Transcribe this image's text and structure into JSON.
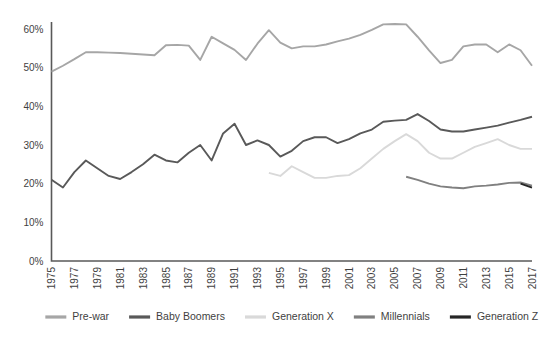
{
  "chart_data": {
    "type": "line",
    "title": "",
    "subtitle": "",
    "xlabel": "",
    "ylabel": "",
    "xlim": [
      1975,
      2017
    ],
    "ylim": [
      0,
      60
    ],
    "grid": false,
    "legend_position": "bottom",
    "y_ticks": [
      "0%",
      "10%",
      "20%",
      "30%",
      "40%",
      "50%",
      "60%"
    ],
    "y_tick_values": [
      0,
      10,
      20,
      30,
      40,
      50,
      60
    ],
    "x_ticks": [
      "1975",
      "1977",
      "1979",
      "1981",
      "1983",
      "1985",
      "1987",
      "1989",
      "1991",
      "1993",
      "1995",
      "1997",
      "1999",
      "2001",
      "2003",
      "2005",
      "2007",
      "2009",
      "2011",
      "2013",
      "2015",
      "2017"
    ],
    "x_tick_values": [
      1975,
      1977,
      1979,
      1981,
      1983,
      1985,
      1987,
      1989,
      1991,
      1993,
      1995,
      1997,
      1999,
      2001,
      2003,
      2005,
      2007,
      2009,
      2011,
      2013,
      2015,
      2017
    ],
    "series": [
      {
        "name": "Pre-war",
        "color": "#A6A6A6",
        "x": [
          1975,
          1976,
          1977,
          1978,
          1979,
          1980,
          1981,
          1982,
          1983,
          1984,
          1985,
          1986,
          1987,
          1988,
          1989,
          1990,
          1991,
          1992,
          1993,
          1994,
          1995,
          1996,
          1997,
          1998,
          1999,
          2000,
          2001,
          2002,
          2003,
          2004,
          2005,
          2006,
          2007,
          2008,
          2009,
          2010,
          2011,
          2012,
          2013,
          2014,
          2015,
          2016,
          2017
        ],
        "values": [
          49.0,
          50.5,
          52.2,
          54.0,
          54.0,
          53.9,
          53.8,
          53.6,
          53.4,
          53.2,
          55.8,
          55.9,
          55.7,
          52.0,
          58.0,
          56.3,
          54.6,
          52.0,
          56.2,
          59.7,
          56.5,
          55.0,
          55.5,
          55.5,
          56.0,
          56.8,
          57.5,
          58.5,
          59.8,
          61.2,
          61.3,
          61.2,
          58.0,
          54.5,
          51.2,
          52.0,
          55.5,
          56.0,
          56.0,
          54.0,
          56.0,
          54.5,
          50.5
        ]
      },
      {
        "name": "Baby Boomers",
        "color": "#595959",
        "x": [
          1975,
          1976,
          1977,
          1978,
          1979,
          1980,
          1981,
          1982,
          1983,
          1984,
          1985,
          1986,
          1987,
          1988,
          1989,
          1990,
          1991,
          1992,
          1993,
          1994,
          1995,
          1996,
          1997,
          1998,
          1999,
          2000,
          2001,
          2002,
          2003,
          2004,
          2005,
          2006,
          2007,
          2008,
          2009,
          2010,
          2011,
          2012,
          2013,
          2014,
          2015,
          2016,
          2017
        ],
        "values": [
          21.0,
          19.0,
          23.0,
          26.0,
          24.0,
          22.0,
          21.2,
          23.0,
          25.0,
          27.5,
          26.0,
          25.5,
          28.0,
          30.0,
          26.0,
          33.0,
          35.5,
          30.0,
          31.2,
          30.0,
          27.0,
          28.5,
          31.0,
          32.0,
          32.0,
          30.5,
          31.5,
          33.0,
          34.0,
          36.0,
          36.3,
          36.5,
          38.0,
          36.2,
          34.0,
          33.5,
          33.5,
          34.0,
          34.5,
          35.0,
          35.8,
          36.5,
          37.3
        ]
      },
      {
        "name": "Generation X",
        "color": "#D9D9D9",
        "x": [
          1994,
          1995,
          1996,
          1997,
          1998,
          1999,
          2000,
          2001,
          2002,
          2003,
          2004,
          2005,
          2006,
          2007,
          2008,
          2009,
          2010,
          2011,
          2012,
          2013,
          2014,
          2015,
          2016,
          2017
        ],
        "values": [
          22.8,
          22.0,
          24.5,
          23.0,
          21.5,
          21.5,
          22.0,
          22.2,
          24.0,
          26.5,
          29.0,
          31.0,
          32.8,
          31.0,
          28.0,
          26.5,
          26.5,
          28.0,
          29.5,
          30.5,
          31.5,
          30.0,
          29.0,
          29.0
        ]
      },
      {
        "name": "Millennials",
        "color": "#808080",
        "x": [
          2006,
          2007,
          2008,
          2009,
          2010,
          2011,
          2012,
          2013,
          2014,
          2015,
          2016,
          2017
        ],
        "values": [
          21.8,
          21.0,
          20.0,
          19.3,
          19.0,
          18.8,
          19.3,
          19.5,
          19.8,
          20.2,
          20.3,
          19.5
        ]
      },
      {
        "name": "Generation Z",
        "color": "#262626",
        "x": [
          2016,
          2017
        ],
        "values": [
          20.0,
          19.0
        ]
      }
    ]
  }
}
